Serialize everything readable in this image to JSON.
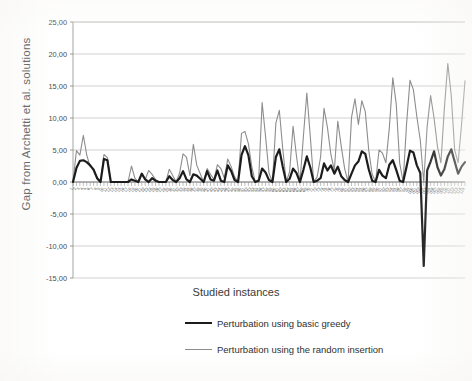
{
  "chart_data": {
    "type": "line",
    "title": "",
    "xlabel": "Studied instances",
    "ylabel": "Gap from Archetti et al.  solutions",
    "ylim": [
      -15,
      25
    ],
    "ytick_labels": [
      "25,00",
      "20,00",
      "15,00",
      "10,00",
      "5,00",
      "0,00",
      "-5,00",
      "-10,00",
      "-15,00"
    ],
    "ytick_values": [
      25,
      20,
      15,
      10,
      5,
      0,
      -5,
      -10,
      -15
    ],
    "grid": true,
    "legend_position": "bottom",
    "x_axis_note": "Instance indices 1..115, rotated labels, every instance ticked",
    "x": [
      1,
      2,
      3,
      4,
      5,
      6,
      7,
      8,
      9,
      10,
      11,
      12,
      13,
      14,
      15,
      16,
      17,
      18,
      19,
      20,
      21,
      22,
      23,
      24,
      25,
      26,
      27,
      28,
      29,
      30,
      31,
      32,
      33,
      34,
      35,
      36,
      37,
      38,
      39,
      40,
      41,
      42,
      43,
      44,
      45,
      46,
      47,
      48,
      49,
      50,
      51,
      52,
      53,
      54,
      55,
      56,
      57,
      58,
      59,
      60,
      61,
      62,
      63,
      64,
      65,
      66,
      67,
      68,
      69,
      70,
      71,
      72,
      73,
      74,
      75,
      76,
      77,
      78,
      79,
      80,
      81,
      82,
      83,
      84,
      85,
      86,
      87,
      88,
      89,
      90,
      91,
      92,
      93,
      94,
      95,
      96,
      97,
      98,
      99,
      100,
      101,
      102,
      103,
      104,
      105,
      106,
      107,
      108,
      109,
      110,
      111,
      112,
      113,
      114,
      115
    ],
    "xtick_labels_visible_sample": [
      "103",
      "112",
      "115"
    ],
    "series": [
      {
        "name": "Perturbation using basic greedy",
        "color": "#1c1c1c",
        "width": 2.2,
        "values": [
          0.0,
          2.2,
          3.3,
          3.4,
          3.1,
          2.6,
          1.9,
          0.6,
          0.0,
          3.6,
          3.4,
          0.0,
          0.0,
          0.0,
          0.0,
          0.0,
          0.0,
          0.4,
          0.2,
          0.0,
          1.3,
          0.4,
          0.0,
          0.6,
          0.2,
          0.0,
          0.0,
          0.0,
          0.9,
          0.3,
          0.0,
          0.6,
          1.7,
          0.4,
          0.0,
          1.2,
          1.0,
          0.5,
          0.0,
          1.7,
          0.4,
          0.2,
          1.8,
          0.2,
          0.0,
          2.6,
          1.7,
          0.3,
          0.0,
          4.2,
          5.6,
          4.2,
          0.9,
          0.0,
          0.2,
          2.1,
          1.5,
          0.3,
          0.0,
          3.9,
          5.1,
          2.4,
          0.0,
          0.5,
          2.1,
          1.4,
          0.0,
          1.9,
          4.0,
          2.3,
          0.0,
          0.2,
          0.6,
          2.9,
          1.8,
          2.6,
          1.3,
          2.4,
          0.9,
          0.3,
          0.0,
          1.3,
          2.6,
          3.2,
          4.8,
          4.4,
          2.0,
          0.2,
          0.0,
          1.9,
          1.0,
          0.6,
          2.7,
          3.4,
          1.9,
          0.2,
          0.0,
          2.4,
          4.9,
          4.6,
          2.6,
          1.4,
          -13.1,
          1.8,
          3.2,
          4.8,
          2.3,
          1.0,
          2.0,
          4.0,
          5.1,
          3.2,
          1.3,
          2.4,
          3.1
        ]
      },
      {
        "name": "Perturbation using the random insertion",
        "color": "#8d8d8d",
        "width": 1.1,
        "values": [
          0.0,
          4.9,
          4.2,
          7.3,
          4.2,
          2.4,
          2.1,
          0.8,
          0.0,
          4.3,
          3.8,
          0.0,
          0.0,
          0.0,
          0.0,
          0.0,
          0.0,
          2.5,
          0.6,
          0.0,
          1.3,
          0.4,
          1.8,
          1.2,
          0.4,
          0.0,
          0.0,
          0.0,
          2.0,
          1.0,
          0.0,
          1.4,
          4.4,
          3.9,
          1.0,
          5.9,
          2.6,
          1.3,
          0.0,
          2.1,
          1.2,
          0.4,
          2.7,
          2.1,
          0.6,
          3.6,
          2.4,
          0.8,
          0.0,
          7.6,
          7.9,
          6.0,
          2.4,
          0.0,
          0.4,
          12.4,
          7.1,
          1.4,
          0.0,
          9.2,
          11.2,
          5.2,
          0.0,
          1.6,
          8.7,
          4.0,
          0.0,
          7.1,
          13.9,
          7.2,
          0.0,
          0.8,
          3.9,
          11.5,
          8.5,
          4.3,
          1.8,
          9.5,
          5.6,
          2.1,
          0.0,
          10.1,
          13.0,
          9.0,
          12.7,
          11.0,
          5.0,
          1.2,
          0.0,
          5.0,
          4.5,
          3.0,
          8.5,
          16.3,
          12.2,
          3.0,
          0.0,
          9.0,
          15.9,
          14.4,
          10.2,
          6.5,
          0.0,
          8.7,
          13.5,
          10.0,
          5.5,
          3.0,
          11.5,
          18.5,
          13.5,
          5.0,
          3.0,
          9.0,
          15.8
        ]
      }
    ]
  },
  "axis": {
    "x_title": "Studied instances",
    "y_title": "Gap from Archetti et al.  solutions"
  },
  "legend": {
    "items": [
      {
        "label": "Perturbation using basic greedy"
      },
      {
        "label": "Perturbation using the random insertion"
      }
    ]
  }
}
